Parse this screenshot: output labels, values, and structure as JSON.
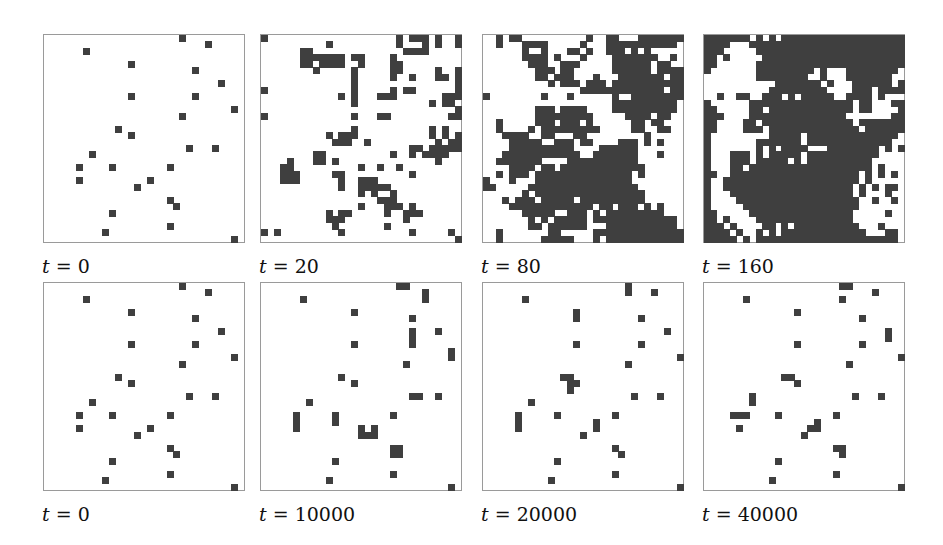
{
  "figure": {
    "grid": {
      "cols": 31,
      "rows": 32
    },
    "cell_color": "#3f3f3f",
    "panels": [
      {
        "id": "p1",
        "label": "t = 0",
        "var": "t",
        "value": "0",
        "x": 43,
        "y": 34,
        "cells": [
          [
            21,
            0
          ],
          [
            25,
            1
          ],
          [
            6,
            2
          ],
          [
            13,
            4
          ],
          [
            23,
            5
          ],
          [
            27,
            7
          ],
          [
            13,
            9
          ],
          [
            23,
            9
          ],
          [
            29,
            11
          ],
          [
            21,
            12
          ],
          [
            11,
            14
          ],
          [
            13,
            15
          ],
          [
            22,
            17
          ],
          [
            26,
            17
          ],
          [
            7,
            18
          ],
          [
            5,
            20
          ],
          [
            10,
            20
          ],
          [
            19,
            20
          ],
          [
            5,
            22
          ],
          [
            16,
            22
          ],
          [
            14,
            23
          ],
          [
            19,
            25
          ],
          [
            20,
            26
          ],
          [
            10,
            27
          ],
          [
            19,
            29
          ],
          [
            9,
            30
          ],
          [
            29,
            31
          ]
        ]
      },
      {
        "id": "p2",
        "label": "t = 20",
        "var": "t",
        "value": "20",
        "x": 260,
        "y": 34,
        "rows": [
          "1....................1.111.1..11",
          "..........1..........1...1.1..1.",
          "......11..............1111.....",
          "......1111111.11....1...........",
          "......11.1111..1....11.........",
          "........1.....1.....11.....1..1.",
          "..............1.....1..1...11.1",
          "..............1...............11",
          "1.............1.....1.11......1.",
          "............1.1...111.......111",
          "..............1...........1.11.",
          "..............................1.",
          "1.............1...11.........11.",
          "...............................1",
          "..............1...........1.1...",
          "..........1.111...........1.1.1.",
          "...........111..1..........1.11.",
          ".......................11.111111",
          "........11..........1..1.1111...",
          "....1...11.1...............1....",
          "...11..........1..1..1..........",
          "...111.....11..........1........",
          "...111......1..111..............",
          "............1..11111...........",
          "...............1.1..1..........",
          "..................111...........",
          "...............1...111.1........",
          "..........1.11.....1..111.......",
          "..........111.........1.........",
          "...........1.......1............",
          "1.1.........1..........1.....1.",
          "..............................11"
        ]
      },
      {
        "id": "p3",
        "label": "t = 80",
        "var": "t",
        "value": "80",
        "x": 482,
        "y": 34,
        "rows": [
          "..1.11..........1..11...1111111.",
          "..1...1111.....1...11111111111..",
          "......1..1...11.1..111.1.1.....1",
          "......1111.1...1....1111111..1..",
          ".......111..111.....111111.11...",
          "........111.11......111111.1111",
          "........11.111...1...1111111.11",
          "..........1.111.111.111111111111",
          "...............1111111111111.11.",
          "1........1...1......1..111111111",
          "....................1111111111..",
          "........111.1111....1111111111..",
          "........111111111.....1111.11...",
          "..1.....111.111.1......11.11....",
          "..1....1.111111111.....11..11...",
          "...1111..11...11.........1......",
          "....11111..111.11....111.1.1.....",
          "....1111111111....111111.......1",
          "...111111111111..1111111...1....",
          "..1111111....11111111111.......",
          "....1111.11.1111111111111......",
          "..1.111.111111111111111.1......1",
          "1...1...111111111111111........",
          "11.....11111111111111111.......",
          "......1.11111111111111111......",
          "...1.111.11111.1111111111......",
          "....1111111111111.11.111.1.1...",
          "......11111..111.1.111111111....",
          ".......1.1.11111.1111111111111..",
          ".......11.111111...11111111111.1",
          "..1.......11.....11111111111111.",
          "..1......11111...1.1111111111111"
        ]
      },
      {
        "id": "p4",
        "label": "t = 160",
        "var": "t",
        "value": "160",
        "x": 703,
        "y": 34,
        "rows": [
          "1111111.1.1.11111111111111111111",
          "1111...1111111111111111111111111",
          "111.....11111111111111111111111.",
          "11.1.....11111111111111111111111",
          "11......1111111111111111111111111",
          "1.......111111111.1...11111111.",
          "........11111111..1...1111111.",
          "...........1111111.1...111111.1",
          "..........111111111....111.1111",
          "..1..11..111.1.11111..1111.1..",
          "1......1111111111111111.11...11",
          "11.....11.1111111111111.11....1",
          "111....111111111111111.......11",
          "11....11.11111111111111.1111111",
          "11....111.11111111111111.111111",
          "1.........11111.11111111111111",
          "1.......1111111.1111111111111.",
          "1.......1.1.1111...11111111.1.1",
          "1...111.1.11111.11111111111...",
          "1...111.11111.1.1111111111.....",
          "1...11.1111111111111111111.1...",
          "11..11111111111111111111.1.1.1",
          "1..111111111111111111111.1...",
          "1..11111111111111111111.1.1.11",
          "1...1111111111111111111.1...1",
          "1....1111111111111111111..1..1",
          "1.....111111111111111111......",
          "11.....1111111111111111.....1",
          "11.1....111111111111111......",
          "111.1....11.1.1111111111...1.",
          "1111.1..1.1.1111111111111...11",
          "11111.1.1111111111111111111111"
        ]
      },
      {
        "id": "p5",
        "label": "t = 0",
        "var": "t",
        "value": "0",
        "x": 43,
        "y": 282,
        "cells": [
          [
            21,
            0
          ],
          [
            25,
            1
          ],
          [
            6,
            2
          ],
          [
            13,
            4
          ],
          [
            23,
            5
          ],
          [
            27,
            7
          ],
          [
            13,
            9
          ],
          [
            23,
            9
          ],
          [
            29,
            11
          ],
          [
            21,
            12
          ],
          [
            11,
            14
          ],
          [
            13,
            15
          ],
          [
            22,
            17
          ],
          [
            26,
            17
          ],
          [
            7,
            18
          ],
          [
            5,
            20
          ],
          [
            10,
            20
          ],
          [
            19,
            20
          ],
          [
            5,
            22
          ],
          [
            16,
            22
          ],
          [
            14,
            23
          ],
          [
            19,
            25
          ],
          [
            20,
            26
          ],
          [
            10,
            27
          ],
          [
            19,
            29
          ],
          [
            9,
            30
          ],
          [
            29,
            31
          ]
        ]
      },
      {
        "id": "p6",
        "label": "t = 10000",
        "var": "t",
        "value": "10000",
        "x": 260,
        "y": 282,
        "cells": [
          [
            21,
            0
          ],
          [
            22,
            0
          ],
          [
            25,
            1
          ],
          [
            25,
            2
          ],
          [
            6,
            2
          ],
          [
            14,
            4
          ],
          [
            23,
            5
          ],
          [
            23,
            7
          ],
          [
            23,
            8
          ],
          [
            23,
            9
          ],
          [
            27,
            7
          ],
          [
            14,
            9
          ],
          [
            29,
            10
          ],
          [
            29,
            11
          ],
          [
            22,
            12
          ],
          [
            12,
            14
          ],
          [
            14,
            15
          ],
          [
            23,
            17
          ],
          [
            24,
            17
          ],
          [
            27,
            17
          ],
          [
            7,
            18
          ],
          [
            5,
            20
          ],
          [
            5,
            21
          ],
          [
            5,
            22
          ],
          [
            11,
            20
          ],
          [
            11,
            21
          ],
          [
            20,
            20
          ],
          [
            15,
            22
          ],
          [
            17,
            22
          ],
          [
            15,
            23
          ],
          [
            16,
            23
          ],
          [
            17,
            23
          ],
          [
            20,
            25
          ],
          [
            21,
            25
          ],
          [
            20,
            26
          ],
          [
            21,
            26
          ],
          [
            11,
            27
          ],
          [
            20,
            29
          ],
          [
            10,
            30
          ],
          [
            29,
            31
          ]
        ]
      },
      {
        "id": "p7",
        "label": "t = 20000",
        "var": "t",
        "value": "20000",
        "x": 482,
        "y": 282,
        "cells": [
          [
            22,
            0
          ],
          [
            22,
            1
          ],
          [
            26,
            1
          ],
          [
            6,
            2
          ],
          [
            14,
            4
          ],
          [
            14,
            5
          ],
          [
            24,
            5
          ],
          [
            28,
            7
          ],
          [
            14,
            9
          ],
          [
            24,
            9
          ],
          [
            30,
            11
          ],
          [
            22,
            12
          ],
          [
            12,
            14
          ],
          [
            13,
            14
          ],
          [
            13,
            15
          ],
          [
            14,
            15
          ],
          [
            13,
            16
          ],
          [
            23,
            17
          ],
          [
            27,
            17
          ],
          [
            7,
            18
          ],
          [
            5,
            20
          ],
          [
            5,
            21
          ],
          [
            5,
            22
          ],
          [
            11,
            20
          ],
          [
            17,
            21
          ],
          [
            17,
            22
          ],
          [
            20,
            20
          ],
          [
            15,
            23
          ],
          [
            20,
            25
          ],
          [
            21,
            26
          ],
          [
            11,
            27
          ],
          [
            20,
            29
          ],
          [
            10,
            30
          ],
          [
            30,
            31
          ]
        ]
      },
      {
        "id": "p8",
        "label": "t = 40000",
        "var": "t",
        "value": "40000",
        "x": 703,
        "y": 282,
        "cells": [
          [
            21,
            0
          ],
          [
            22,
            0
          ],
          [
            26,
            1
          ],
          [
            6,
            2
          ],
          [
            21,
            2
          ],
          [
            14,
            4
          ],
          [
            24,
            5
          ],
          [
            28,
            7
          ],
          [
            28,
            8
          ],
          [
            14,
            9
          ],
          [
            24,
            9
          ],
          [
            30,
            11
          ],
          [
            22,
            12
          ],
          [
            12,
            14
          ],
          [
            13,
            14
          ],
          [
            14,
            15
          ],
          [
            7,
            17
          ],
          [
            7,
            18
          ],
          [
            23,
            17
          ],
          [
            27,
            17
          ],
          [
            4,
            20
          ],
          [
            5,
            20
          ],
          [
            6,
            20
          ],
          [
            11,
            20
          ],
          [
            20,
            20
          ],
          [
            5,
            22
          ],
          [
            17,
            21
          ],
          [
            16,
            22
          ],
          [
            17,
            22
          ],
          [
            15,
            23
          ],
          [
            20,
            25
          ],
          [
            21,
            25
          ],
          [
            21,
            26
          ],
          [
            11,
            27
          ],
          [
            20,
            29
          ],
          [
            10,
            30
          ],
          [
            30,
            31
          ]
        ]
      }
    ]
  }
}
